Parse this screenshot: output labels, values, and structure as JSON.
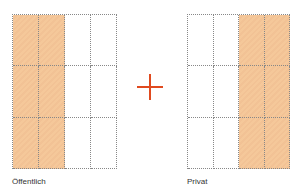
{
  "diagram": {
    "left": {
      "label": "Öffentlich",
      "columns": 4,
      "rows": 3,
      "filled_columns": [
        0,
        1
      ]
    },
    "operator": {
      "symbol": "+",
      "color": "#e04a1f"
    },
    "right": {
      "label": "Privat",
      "columns": 4,
      "rows": 3,
      "filled_columns": [
        2,
        3
      ]
    },
    "colors": {
      "fill": "#f5c89a",
      "grid_line": "#888888"
    }
  }
}
